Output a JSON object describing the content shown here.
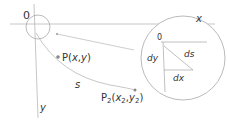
{
  "diagram": {
    "origin_label": "0",
    "x_axis_label": "x",
    "y_axis_label": "y",
    "point_p_label": "P(x,y)",
    "point_p2_label": "P",
    "point_p2_sub": "2",
    "point_p2_coords_open": "(x",
    "point_p2_coords_sub_x": "2",
    "point_p2_coords_mid": ",y",
    "point_p2_coords_sub_y": "2",
    "point_p2_coords_close": ")",
    "arc_length_label": "s",
    "zoom_inset": {
      "origin_label": "0",
      "dy_label": "dy",
      "dx_label": "dx",
      "ds_label": "ds"
    },
    "colors": {
      "line": "#b8b8b8",
      "text": "#333333",
      "point": "#888888"
    }
  }
}
